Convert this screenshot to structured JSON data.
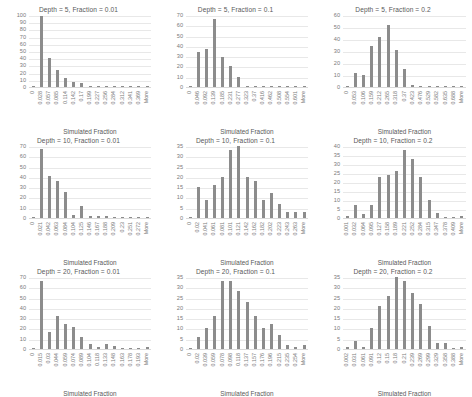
{
  "figure": {
    "xlabel": "Simulated Fraction",
    "bar_color": "#8c8c8c",
    "grid_color": "#e8e8e8",
    "axis_color": "#d9d9d9",
    "text_color": "#595959"
  },
  "chart_data": [
    {
      "type": "bar",
      "title": "Depth = 5, Fraction = 0.01",
      "xlabel": "Simulated Fraction",
      "ylabel": "",
      "ylim": [
        0,
        100
      ],
      "yticks": [
        0,
        10,
        20,
        30,
        40,
        50,
        60,
        70,
        80,
        90,
        100
      ],
      "grid": true,
      "categories": [
        "0",
        "0.028",
        "0.057",
        "0.085",
        "0.114",
        "0.142",
        "0.17",
        "0.199",
        "0.227",
        "0.256",
        "0.284",
        "0.312",
        "0.341",
        "0.369",
        "More"
      ],
      "values": [
        0,
        98,
        40,
        24,
        13,
        7,
        6,
        1,
        1,
        1,
        0,
        0,
        0,
        0,
        0
      ]
    },
    {
      "type": "bar",
      "title": "Depth = 5, Fraction = 0.1",
      "xlabel": "Simulated Fraction",
      "ylabel": "",
      "ylim": [
        0,
        70
      ],
      "yticks": [
        0,
        10,
        20,
        30,
        40,
        50,
        60,
        70
      ],
      "grid": true,
      "categories": [
        "0",
        "0.046",
        "0.092",
        "0.139",
        "0.185",
        "0.231",
        "0.277",
        "0.323",
        "0.37",
        "0.416",
        "0.462",
        "0.508",
        "0.554",
        "0.601",
        "More"
      ],
      "values": [
        0,
        34,
        37,
        66,
        29,
        20,
        10,
        1,
        0,
        0,
        0,
        0,
        0,
        0,
        0
      ]
    },
    {
      "type": "bar",
      "title": "Depth = 5, Fraction = 0.2",
      "xlabel": "Simulated Fraction",
      "ylabel": "",
      "ylim": [
        0,
        60
      ],
      "yticks": [
        0,
        10,
        20,
        30,
        40,
        50,
        60
      ],
      "grid": true,
      "categories": [
        "0",
        "0.053",
        "0.106",
        "0.159",
        "0.212",
        "0.265",
        "0.318",
        "0.37",
        "0.423",
        "0.476",
        "0.529",
        "0.582",
        "0.635",
        "0.688",
        "More"
      ],
      "values": [
        0,
        12,
        10,
        34,
        42,
        52,
        31,
        15,
        2,
        0,
        0,
        0,
        0,
        0,
        0
      ]
    },
    {
      "type": "bar",
      "title": "Depth = 10, Fraction = 0.01",
      "xlabel": "Simulated Fraction",
      "ylabel": "",
      "ylim": [
        0,
        70
      ],
      "yticks": [
        0,
        10,
        20,
        30,
        40,
        50,
        60,
        70
      ],
      "grid": true,
      "categories": [
        "0",
        "0.021",
        "0.042",
        "0.063",
        "0.084",
        "0.104",
        "0.125",
        "0.146",
        "0.167",
        "0.188",
        "0.209",
        "0.23",
        "0.251",
        "0.272",
        "More"
      ],
      "values": [
        0,
        67,
        41,
        36,
        25,
        3,
        12,
        2,
        2,
        2,
        1,
        1,
        0,
        0,
        0
      ]
    },
    {
      "type": "bar",
      "title": "Depth = 10, Fraction = 0.1",
      "xlabel": "Simulated Fraction",
      "ylabel": "",
      "ylim": [
        0,
        35
      ],
      "yticks": [
        0,
        5,
        10,
        15,
        20,
        25,
        30,
        35
      ],
      "grid": true,
      "categories": [
        "0",
        "0.02",
        "0.041",
        "0.061",
        "0.081",
        "0.101",
        "0.121",
        "0.142",
        "0.162",
        "0.182",
        "0.202",
        "0.223",
        "0.243",
        "0.263",
        "More"
      ],
      "values": [
        0,
        15,
        9,
        16,
        20,
        33,
        35,
        20,
        18,
        9,
        12,
        7,
        3,
        3,
        3
      ]
    },
    {
      "type": "bar",
      "title": "Depth = 10, Fraction = 0.2",
      "xlabel": "Simulated Fraction",
      "ylabel": "",
      "ylim": [
        0,
        40
      ],
      "yticks": [
        0,
        5,
        10,
        15,
        20,
        25,
        30,
        35,
        40
      ],
      "grid": true,
      "categories": [
        "0.001",
        "0.032",
        "0.064",
        "0.095",
        "0.127",
        "0.158",
        "0.189",
        "0.221",
        "0.252",
        "0.284",
        "0.315",
        "0.347",
        "0.378",
        "0.409",
        "More"
      ],
      "values": [
        1,
        7,
        2,
        7,
        23,
        24,
        26,
        38,
        33,
        23,
        10,
        3,
        0,
        0,
        1
      ]
    },
    {
      "type": "bar",
      "title": "Depth = 20, Fraction = 0.01",
      "xlabel": "Simulated Fraction",
      "ylabel": "",
      "ylim": [
        0,
        70
      ],
      "yticks": [
        0,
        10,
        20,
        30,
        40,
        50,
        60,
        70
      ],
      "grid": true,
      "categories": [
        "0",
        "0.015",
        "0.03",
        "0.044",
        "0.059",
        "0.074",
        "0.089",
        "0.104",
        "0.118",
        "0.133",
        "0.148",
        "0.163",
        "0.178",
        "0.193",
        "More"
      ],
      "values": [
        0,
        66,
        17,
        32,
        24,
        21,
        12,
        5,
        2,
        5,
        3,
        1,
        0,
        0,
        2
      ]
    },
    {
      "type": "bar",
      "title": "Depth = 20, Fraction = 0.1",
      "xlabel": "Simulated Fraction",
      "ylabel": "",
      "ylim": [
        0,
        35
      ],
      "yticks": [
        0,
        5,
        10,
        15,
        20,
        25,
        30,
        35
      ],
      "grid": true,
      "categories": [
        "0",
        "0.02",
        "0.039",
        "0.059",
        "0.078",
        "0.098",
        "0.118",
        "0.137",
        "0.157",
        "0.176",
        "0.196",
        "0.215",
        "0.235",
        "0.254",
        "More"
      ],
      "values": [
        0,
        6,
        10,
        16,
        33,
        33,
        28,
        23,
        16,
        10,
        12,
        7,
        2,
        1,
        2
      ]
    },
    {
      "type": "bar",
      "title": "Depth = 20, Fraction = 0.2",
      "xlabel": "Simulated Fraction",
      "ylabel": "",
      "ylim": [
        0,
        35
      ],
      "yticks": [
        0,
        5,
        10,
        15,
        20,
        25,
        30,
        35
      ],
      "grid": true,
      "categories": [
        "0.002",
        "0.031",
        "0.061",
        "0.091",
        "0.12",
        "0.15",
        "0.18",
        "0.21",
        "0.239",
        "0.269",
        "0.299",
        "0.329",
        "0.358",
        "0.388",
        "More"
      ],
      "values": [
        1,
        4,
        1,
        10,
        21,
        26,
        35,
        33,
        27,
        22,
        11,
        3,
        3,
        0,
        1
      ]
    }
  ]
}
